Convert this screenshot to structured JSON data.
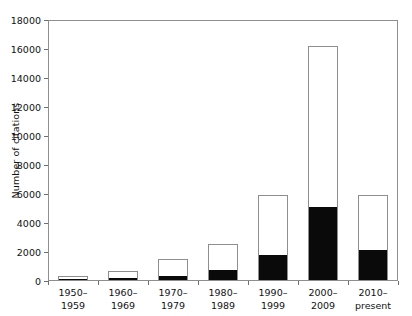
{
  "chart_data": {
    "type": "bar",
    "stacked": true,
    "title": "",
    "subtitle": "",
    "xlabel": "",
    "ylabel": "Number of citations",
    "categories": [
      "1950–\n1959",
      "1960–\n1969",
      "1970–\n1979",
      "1980–\n1989",
      "1990–\n1999",
      "2000–\n2009",
      "2010–\npresent"
    ],
    "ylim": [
      0,
      18000
    ],
    "yticks": [
      0,
      2000,
      4000,
      6000,
      8000,
      10000,
      12000,
      14000,
      16000,
      18000
    ],
    "ytick_labels": [
      "0",
      "2000",
      "4000",
      "6000",
      "8000",
      "10000",
      "12000",
      "14000",
      "16000",
      "18000"
    ],
    "grid": false,
    "legend": null,
    "series": [
      {
        "name": "lower-segment-filled",
        "color": "#0a0a0a",
        "values": [
          30,
          150,
          300,
          680,
          1750,
          5000,
          2050
        ]
      },
      {
        "name": "upper-segment-open",
        "color": "#ffffff",
        "values": [
          320,
          530,
          1250,
          1870,
          4150,
          11200,
          3900
        ]
      }
    ],
    "totals": [
      350,
      680,
      1550,
      2550,
      5900,
      16200,
      5950
    ]
  },
  "axes": {
    "y_title": "Number of citations"
  }
}
